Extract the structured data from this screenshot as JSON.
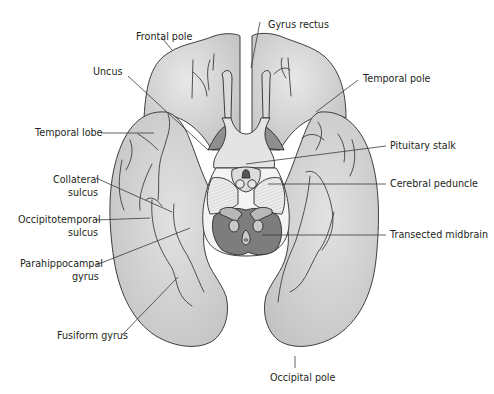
{
  "figure": {
    "type": "anatomical-diagram",
    "colors": {
      "cortex_fill": "#c9c9c9",
      "cortex_highlight": "#e6e6e6",
      "outline": "#2b2b2b",
      "midbrain_dark": "#7d7d7d",
      "peduncle_light": "#e9e9e9",
      "background": "#ffffff",
      "label_text": "#231f20"
    }
  },
  "labels": {
    "frontal_pole": "Frontal pole",
    "gyrus_rectus": "Gyrus rectus",
    "uncus": "Uncus",
    "temporal_pole": "Temporal pole",
    "temporal_lobe": "Temporal lobe",
    "pituitary_stalk": "Pituitary stalk",
    "collateral_sulcus_line1": "Collateral",
    "collateral_sulcus_line2": "sulcus",
    "cerebral_peduncle": "Cerebral peduncle",
    "occipitotemporal_sulcus_line1": "Occipitotemporal",
    "occipitotemporal_sulcus_line2": "sulcus",
    "transected_midbrain": "Transected midbrain",
    "parahippocampal_gyrus_line1": "Parahippocampal",
    "parahippocampal_gyrus_line2": "gyrus",
    "fusiform_gyrus": "Fusiform gyrus",
    "occipital_pole": "Occipital pole"
  }
}
